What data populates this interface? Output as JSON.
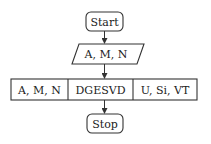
{
  "diagram": {
    "type": "flowchart",
    "nodes": [
      {
        "id": "start",
        "shape": "terminator",
        "label": "Start"
      },
      {
        "id": "input",
        "shape": "data",
        "label": "A, M, N"
      },
      {
        "id": "process",
        "shape": "process-with-io",
        "cells": [
          "A, M, N",
          "DGESVD",
          "U, Si, VT"
        ]
      },
      {
        "id": "stop",
        "shape": "terminator",
        "label": "Stop"
      }
    ],
    "edges": [
      {
        "from": "start",
        "to": "input"
      },
      {
        "from": "input",
        "to": "process"
      },
      {
        "from": "process",
        "to": "stop"
      }
    ]
  }
}
